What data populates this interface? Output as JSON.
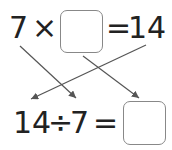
{
  "top_equation": {
    "left": "7",
    "op": "×",
    "blank": "",
    "eq": "=",
    "result": "14"
  },
  "bottom_equation": {
    "left": "14",
    "op": "÷",
    "right": "7",
    "eq": "=",
    "blank": ""
  },
  "colors": {
    "text": "#222222",
    "arrow": "#555555",
    "box_border": "#888888"
  }
}
